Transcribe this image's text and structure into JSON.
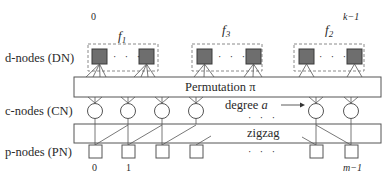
{
  "diagram": {
    "type": "bipartite-graph-structure",
    "row_labels": {
      "d_nodes": "d-nodes (DN)",
      "c_nodes": "c-nodes (CN)",
      "p_nodes": "p-nodes (PN)"
    },
    "top_indices": {
      "first": "0",
      "last": "k−1"
    },
    "groups": [
      {
        "label": "f",
        "subscript": "1",
        "x": 88
      },
      {
        "label": "f",
        "subscript": "3",
        "x": 192
      },
      {
        "label": "f",
        "subscript": "2",
        "x": 294
      }
    ],
    "group_dots": "· · ·",
    "permutation_label": "Permutation π",
    "degree_label": "degree",
    "degree_var": "a",
    "middle_dots": "· · ·",
    "zigzag_label": "zigzag",
    "bottom_dots": "· · ·",
    "bottom_indices": {
      "first": "0",
      "second": "1",
      "last": "m−1"
    },
    "c_node_x": [
      95,
      128,
      162,
      196,
      316,
      351
    ],
    "colors": {
      "d_node_fill": "#6e6e6e",
      "stroke": "#555555",
      "dashed": "#888888",
      "background": "#ffffff"
    }
  }
}
